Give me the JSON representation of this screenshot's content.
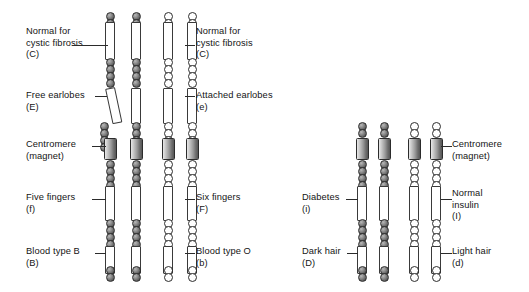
{
  "figure": {
    "bead_colors": {
      "maternal": "#6e6e6e",
      "paternal": "#ffffff",
      "centromere": "#8f8f8f"
    }
  },
  "left_set": {
    "name": "long-chromosome-pair",
    "left_labels": [
      {
        "id": "cystic-fibrosis-left",
        "line1": "Normal for",
        "line2": "cystic fibrosis",
        "allele": "(C)"
      },
      {
        "id": "earlobes-left",
        "line1": "Free earlobes",
        "line2": "",
        "allele": "(E)"
      },
      {
        "id": "centromere-left",
        "line1": "Centromere",
        "line2": "",
        "allele": "(magnet)"
      },
      {
        "id": "fingers-left",
        "line1": "Five fingers",
        "line2": "",
        "allele": "(f)"
      },
      {
        "id": "blood-left",
        "line1": "Blood type B",
        "line2": "",
        "allele": "(B)"
      }
    ],
    "right_labels": [
      {
        "id": "cystic-fibrosis-right",
        "line1": "Normal for",
        "line2": "cystic fibrosis",
        "allele": "(C)"
      },
      {
        "id": "earlobes-right",
        "line1": "Attached earlobes",
        "line2": "",
        "allele": "(e)"
      },
      {
        "id": "fingers-right",
        "line1": "Six fingers",
        "line2": "",
        "allele": "(F)"
      },
      {
        "id": "blood-right",
        "line1": "Blood type O",
        "line2": "",
        "allele": "(b)"
      }
    ]
  },
  "right_set": {
    "name": "short-chromosome-pair",
    "left_labels": [
      {
        "id": "insulin-left",
        "line1": "Diabetes",
        "line2": "",
        "allele": "(i)"
      },
      {
        "id": "hair-left",
        "line1": "Dark hair",
        "line2": "",
        "allele": "(D)"
      }
    ],
    "right_labels": [
      {
        "id": "centromere-right",
        "line1": "Centromere",
        "line2": "",
        "allele": "(magnet)"
      },
      {
        "id": "insulin-right",
        "line1": "Normal",
        "line2": "insulin",
        "allele": "(I)"
      },
      {
        "id": "hair-right",
        "line1": "Light hair",
        "line2": "",
        "allele": "(d)"
      }
    ]
  }
}
